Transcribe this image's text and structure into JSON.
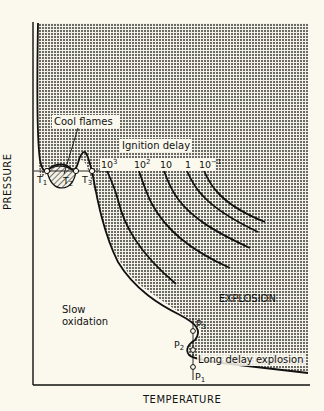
{
  "diagram": {
    "type": "pressure-temperature explosion diagram",
    "axes": {
      "x_label": "TEMPERATURE",
      "y_label": "PRESSURE"
    },
    "regions": {
      "cool_flames": "Cool flames",
      "ignition_delay": "Ignition delay",
      "explosion": "EXPLOSION",
      "slow_oxidation_line1": "Slow",
      "slow_oxidation_line2": "oxidation",
      "long_delay_explosion": "Long delay explosion"
    },
    "temperature_points": [
      {
        "label": "T",
        "sub": "1"
      },
      {
        "label": "T",
        "sub": "2"
      },
      {
        "label": "T",
        "sub": "3"
      }
    ],
    "pressure_points": [
      {
        "label": "P",
        "sub": "1"
      },
      {
        "label": "P",
        "sub": "2"
      },
      {
        "label": "P",
        "sub": "3"
      }
    ],
    "ignition_delay_isolines": [
      {
        "base": "10",
        "exp": "3"
      },
      {
        "base": "10",
        "exp": "2"
      },
      {
        "base": "10",
        "exp": ""
      },
      {
        "base": "1",
        "exp": ""
      },
      {
        "base": "10",
        "exp": "−1"
      }
    ],
    "colors": {
      "background": "#fbf9ee",
      "ink": "#111111",
      "stipple": "#555555"
    }
  }
}
